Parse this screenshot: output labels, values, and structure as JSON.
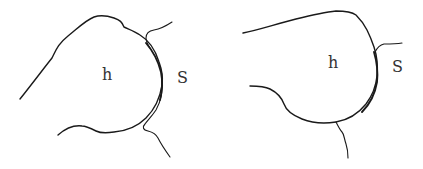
{
  "figures": [
    {
      "id": "left",
      "labels": {
        "head": "h",
        "socket": "S"
      }
    },
    {
      "id": "right",
      "labels": {
        "head": "h",
        "socket": "S"
      }
    }
  ],
  "colors": {
    "line": "#1a1a1a",
    "label": "#333333",
    "background": "#ffffff"
  }
}
